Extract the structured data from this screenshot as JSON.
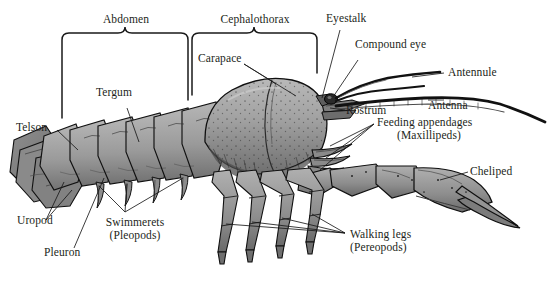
{
  "figure": {
    "background_color": "#ffffff",
    "text_color": "#231f20",
    "line_color": "#1a1a1a",
    "body_fill_light": "#b3b3b3",
    "body_fill_mid": "#949494",
    "body_fill_dark": "#6e6e6e",
    "outline_color": "#111111"
  },
  "brackets": [
    {
      "name": "abdomen",
      "label": "Abdomen"
    },
    {
      "name": "cephalothorax",
      "label": "Cephalothorax"
    }
  ],
  "labels": {
    "abdomen": "Abdomen",
    "cephalothorax": "Cephalothorax",
    "carapace": "Carapace",
    "tergum": "Tergum",
    "telson": "Telson",
    "uropod": "Uropod",
    "pleuron": "Pleuron",
    "swimmerets_1": "Swimmerets",
    "swimmerets_2": "(Pleopods)",
    "eyestalk": "Eyestalk",
    "compound_eye": "Compound eye",
    "antennule": "Antennule",
    "antenna": "Antenna",
    "rostrum": "Rostrum",
    "feeding_1": "Feeding appendages",
    "feeding_2": "(Maxillipeds)",
    "cheliped": "Cheliped",
    "walking_1": "Walking legs",
    "walking_2": "(Pereopods)"
  }
}
